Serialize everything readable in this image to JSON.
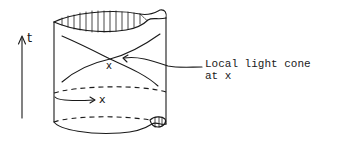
{
  "diagram": {
    "type": "spacetime cylinder with local light cone",
    "time_axis": {
      "label": "t",
      "direction": "up"
    },
    "space_arrow": {
      "label": "x"
    },
    "event_marker": {
      "label": "x"
    },
    "annotation": {
      "line1": "Local light cone",
      "line2": "at x"
    },
    "colors": {
      "ink": "#1a1a1a",
      "background": "#ffffff"
    }
  }
}
